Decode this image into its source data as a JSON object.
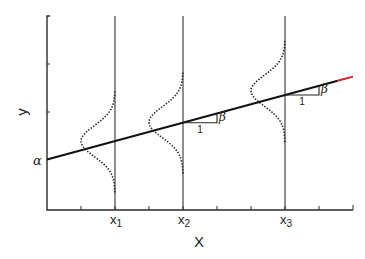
{
  "figure": {
    "type": "regression-model-diagram",
    "x_axis_label": "X",
    "y_axis_label": "y",
    "intercept_label": "α",
    "slope_label": "β",
    "unit_run_label": "1",
    "x_points": [
      {
        "label": "x",
        "subscript": "1"
      },
      {
        "label": "x",
        "subscript": "2"
      },
      {
        "label": "x",
        "subscript": "3"
      }
    ],
    "colors": {
      "line": "#111111",
      "line_tip": "#d0202a",
      "axis": "#2a2a2a"
    }
  },
  "chart_data": {
    "type": "line",
    "title": "",
    "xlabel": "X",
    "ylabel": "y",
    "xlim": [
      0,
      9
    ],
    "ylim": [
      0,
      4
    ],
    "x_ticks": [
      1,
      2,
      3,
      4,
      5,
      6,
      7,
      8,
      9
    ],
    "x_tick_labels": {
      "2": "x1",
      "4": "x2",
      "7": "x3"
    },
    "y_ticks": [
      1,
      2,
      3,
      4
    ],
    "regression_line": {
      "intercept": 1.04,
      "slope": 0.19,
      "x_range": [
        0,
        9
      ],
      "intercept_label": "α",
      "slope_label": "β"
    },
    "conditional_distributions": [
      {
        "x": 2,
        "mean": 1.42,
        "sd": 0.32,
        "shape": "normal"
      },
      {
        "x": 4,
        "mean": 1.81,
        "sd": 0.32,
        "shape": "normal"
      },
      {
        "x": 7,
        "mean": 2.46,
        "sd": 0.32,
        "shape": "normal"
      }
    ],
    "grid": false,
    "legend": "none"
  }
}
